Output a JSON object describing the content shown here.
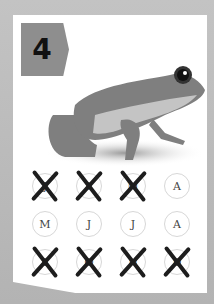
{
  "card": {
    "number": "4",
    "image": "frog-illustration",
    "months": [
      {
        "label": "J",
        "crossed": true
      },
      {
        "label": "F",
        "crossed": true
      },
      {
        "label": "M",
        "crossed": true
      },
      {
        "label": "A",
        "crossed": false
      },
      {
        "label": "M",
        "crossed": false
      },
      {
        "label": "J",
        "crossed": false
      },
      {
        "label": "J",
        "crossed": false
      },
      {
        "label": "A",
        "crossed": false
      },
      {
        "label": "S",
        "crossed": true
      },
      {
        "label": "O",
        "crossed": true
      },
      {
        "label": "N",
        "crossed": true
      },
      {
        "label": "D",
        "crossed": true
      }
    ]
  },
  "colors": {
    "badge": "#8e8e8e",
    "frog_dark": "#7f7f7f",
    "frog_light": "#c4c4c4",
    "cross": "#1d1d1d"
  }
}
